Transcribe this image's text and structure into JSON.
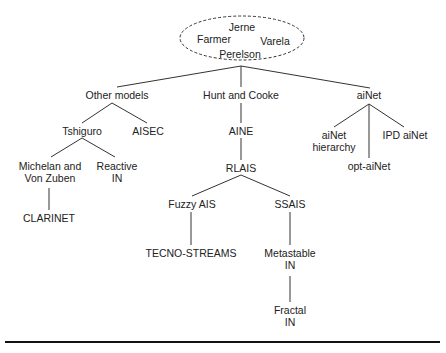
{
  "diagram": {
    "type": "tree",
    "root": {
      "names": [
        "Jerne",
        "Farmer",
        "Varela",
        "Perelson"
      ],
      "style": "dashed-ellipse"
    },
    "nodes": {
      "other_models": "Other models",
      "hunt_cooke": "Hunt and Cooke",
      "ainet": "aiNet",
      "tshiguro": "Tshiguro",
      "aisec": "AISEC",
      "aine": "AINE",
      "ainet_hierarchy": "aiNet\nhierarchy",
      "opt_ainet": "opt-aiNet",
      "ipd_ainet": "IPD aiNet",
      "michelan": "Michelan and\nVon Zuben",
      "reactive_in": "Reactive\nIN",
      "rlais": "RLAIS",
      "clarinet": "CLARINET",
      "fuzzy_ais": "Fuzzy AIS",
      "ssais": "SSAIS",
      "tecno_streams": "TECNO-STREAMS",
      "metastable_in": "Metastable\nIN",
      "fractal_in": "Fractal\nIN"
    },
    "edges": [
      [
        "root",
        "other_models"
      ],
      [
        "root",
        "hunt_cooke"
      ],
      [
        "root",
        "ainet"
      ],
      [
        "other_models",
        "tshiguro"
      ],
      [
        "other_models",
        "aisec"
      ],
      [
        "tshiguro",
        "michelan"
      ],
      [
        "tshiguro",
        "reactive_in"
      ],
      [
        "michelan",
        "clarinet"
      ],
      [
        "hunt_cooke",
        "aine"
      ],
      [
        "aine",
        "rlais"
      ],
      [
        "rlais",
        "fuzzy_ais"
      ],
      [
        "rlais",
        "ssais"
      ],
      [
        "fuzzy_ais",
        "tecno_streams"
      ],
      [
        "ssais",
        "metastable_in"
      ],
      [
        "metastable_in",
        "fractal_in"
      ],
      [
        "ainet",
        "ainet_hierarchy"
      ],
      [
        "ainet",
        "opt_ainet"
      ],
      [
        "ainet",
        "ipd_ainet"
      ]
    ]
  }
}
